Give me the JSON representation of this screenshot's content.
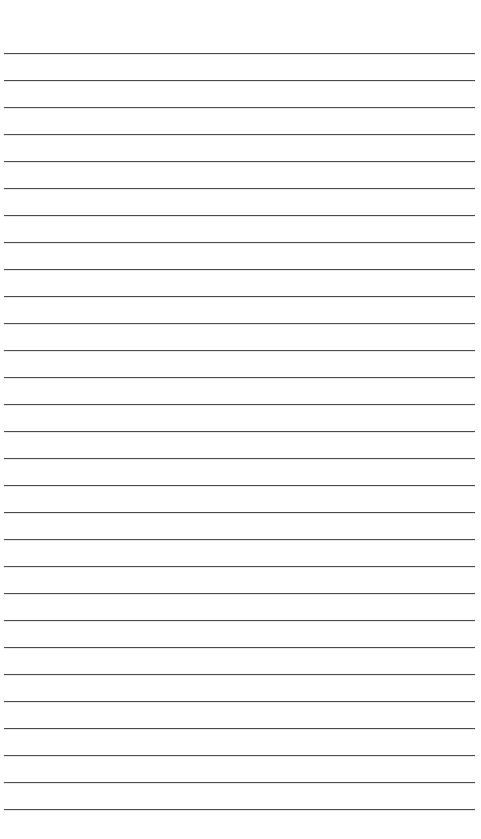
{
  "page": {
    "type": "ruled-paper",
    "background_color": "#ffffff",
    "line_color": "#4a4a4a",
    "line_count": 29,
    "first_line_y": 53,
    "line_spacing": 27,
    "line_left": 4,
    "line_right": 475
  }
}
